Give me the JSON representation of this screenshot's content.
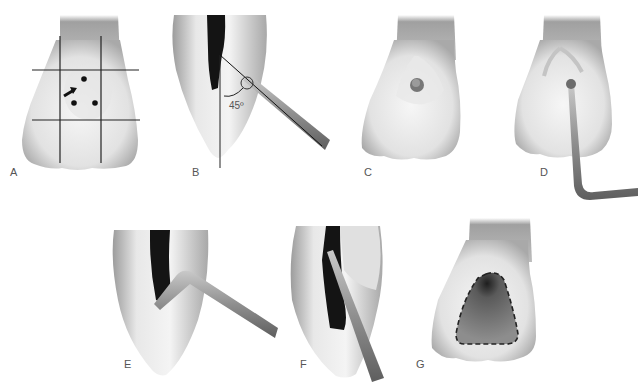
{
  "figure": {
    "panels": [
      {
        "id": "A",
        "label": "A",
        "description": "Labial view of incisor with 3x3 grid lines, three dots and arrow indicating access point"
      },
      {
        "id": "B",
        "label": "B",
        "description": "Proximal section with pulp chamber; bur entering at angle",
        "angle_label": "45º"
      },
      {
        "id": "C",
        "label": "C",
        "description": "Lingual view with initial penetration point"
      },
      {
        "id": "D",
        "label": "D",
        "description": "Lingual view with explorer/instrument in access"
      },
      {
        "id": "E",
        "label": "E",
        "description": "Proximal section with bent instrument in pulp chamber"
      },
      {
        "id": "F",
        "label": "F",
        "description": "Proximal section with straight instrument along canal"
      },
      {
        "id": "G",
        "label": "G",
        "description": "Lingual view with triangular access outline (dashed)"
      }
    ]
  },
  "colors": {
    "background": "#ffffff",
    "tooth_light": "#f2f2f2",
    "tooth_mid": "#c8c8c8",
    "tooth_dark": "#8e8e8e",
    "pulp": "#1a1a1a",
    "instrument": "#8a8a8a",
    "line": "#222222"
  }
}
